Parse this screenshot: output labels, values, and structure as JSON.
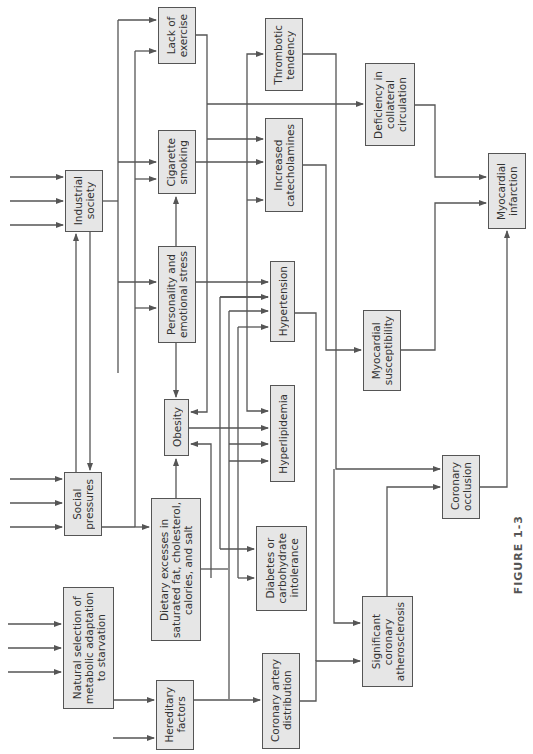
{
  "diagram": {
    "figure_label": "FIGURE 1-3",
    "line_color": "#555555",
    "box_fill": "#e6e6e6",
    "nodes": [
      {
        "id": "lack_exercise",
        "label": "Lack of\nexercise"
      },
      {
        "id": "cigarette",
        "label": "Cigarette\nsmoking"
      },
      {
        "id": "industrial",
        "label": "Industrial\nsociety"
      },
      {
        "id": "personality",
        "label": "Personality and\nemotional stress"
      },
      {
        "id": "obesity",
        "label": "Obesity"
      },
      {
        "id": "social",
        "label": "Social\npressures"
      },
      {
        "id": "dietary",
        "label": "Dietary excesses in\nsaturated fat, cholesterol,\ncalories, and salt"
      },
      {
        "id": "natural",
        "label": "Natural selection of\nmetabolic adaptation\nto starvation"
      },
      {
        "id": "hereditary",
        "label": "Hereditary\nfactors"
      },
      {
        "id": "thrombotic",
        "label": "Thrombotic\ntendency"
      },
      {
        "id": "catecholamines",
        "label": "Increased\ncatecholamines"
      },
      {
        "id": "hypertension",
        "label": "Hypertension"
      },
      {
        "id": "hyperlipidemia",
        "label": "Hyperlipidemia"
      },
      {
        "id": "diabetes",
        "label": "Diabetes or\ncarbohydrate\nintolerance"
      },
      {
        "id": "coronary_dist",
        "label": "Coronary artery\ndistribution"
      },
      {
        "id": "deficiency",
        "label": "Deficiency in\ncollateral\ncirculation"
      },
      {
        "id": "myo_suscept",
        "label": "Myocardial\nsusceptibility"
      },
      {
        "id": "atherosclerosis",
        "label": "Significant\ncoronary\natherosclerosis"
      },
      {
        "id": "occlusion",
        "label": "Coronary\nocclusion"
      },
      {
        "id": "infarction",
        "label": "Myocardial\ninfarction"
      }
    ]
  }
}
